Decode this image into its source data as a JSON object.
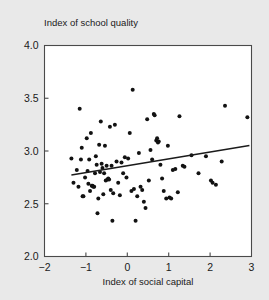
{
  "chart_data": {
    "type": "scatter",
    "title": "",
    "xlabel": "Index of social capital",
    "ylabel": "Index of school quality",
    "ylabel_position": "above-plot-left",
    "xlim": [
      -2,
      3
    ],
    "ylim": [
      2.0,
      4.0
    ],
    "xticks": [
      -2,
      -1,
      0,
      1,
      2,
      3
    ],
    "xticklabels": [
      "-2",
      "-1",
      "0",
      "1",
      "2",
      "3"
    ],
    "yticks": [
      2.0,
      2.5,
      3.0,
      3.5,
      4.0
    ],
    "yticklabels": [
      "2.0",
      "2.5",
      "3.0",
      "3.5",
      "4.0"
    ],
    "grid": false,
    "legend": false,
    "marker": "filled-circle",
    "marker_color": "#121212",
    "marker_size": 3.6,
    "plot_background": "#ffffff",
    "figure_background": "#e9e9e9",
    "frame_color": "#4a4a4a",
    "n_points": 95,
    "series": [
      {
        "name": "counties",
        "points": [
          [
            -1.35,
            2.93
          ],
          [
            -1.3,
            2.7
          ],
          [
            -1.22,
            2.82
          ],
          [
            -1.18,
            2.66
          ],
          [
            -1.15,
            3.4
          ],
          [
            -1.12,
            2.92
          ],
          [
            -1.1,
            3.03
          ],
          [
            -1.08,
            2.57
          ],
          [
            -1.06,
            2.57
          ],
          [
            -1.02,
            2.75
          ],
          [
            -0.98,
            3.12
          ],
          [
            -0.96,
            2.81
          ],
          [
            -0.94,
            2.69
          ],
          [
            -0.92,
            2.92
          ],
          [
            -0.9,
            2.62
          ],
          [
            -0.88,
            3.17
          ],
          [
            -0.86,
            2.67
          ],
          [
            -0.84,
            2.67
          ],
          [
            -0.82,
            2.66
          ],
          [
            -0.8,
            2.66
          ],
          [
            -0.78,
            2.79
          ],
          [
            -0.76,
            2.95
          ],
          [
            -0.74,
            2.87
          ],
          [
            -0.72,
            2.41
          ],
          [
            -0.7,
            2.55
          ],
          [
            -0.68,
            3.06
          ],
          [
            -0.66,
            2.8
          ],
          [
            -0.64,
            3.28
          ],
          [
            -0.62,
            2.88
          ],
          [
            -0.6,
            2.84
          ],
          [
            -0.58,
            2.59
          ],
          [
            -0.56,
            2.79
          ],
          [
            -0.54,
            3.05
          ],
          [
            -0.52,
            2.72
          ],
          [
            -0.5,
            2.86
          ],
          [
            -0.48,
            2.73
          ],
          [
            -0.46,
            2.74
          ],
          [
            -0.44,
            2.73
          ],
          [
            -0.42,
            3.23
          ],
          [
            -0.4,
            2.63
          ],
          [
            -0.38,
            2.86
          ],
          [
            -0.36,
            2.34
          ],
          [
            -0.34,
            2.6
          ],
          [
            -0.3,
            3.25
          ],
          [
            -0.26,
            2.9
          ],
          [
            -0.22,
            2.7
          ],
          [
            -0.18,
            2.58
          ],
          [
            -0.14,
            2.89
          ],
          [
            -0.1,
            2.79
          ],
          [
            -0.06,
            2.94
          ],
          [
            -0.02,
            2.75
          ],
          [
            0.02,
            2.93
          ],
          [
            0.06,
            3.17
          ],
          [
            0.1,
            2.62
          ],
          [
            0.13,
            3.58
          ],
          [
            0.16,
            2.64
          ],
          [
            0.2,
            2.34
          ],
          [
            0.24,
            2.57
          ],
          [
            0.28,
            2.98
          ],
          [
            0.32,
            2.66
          ],
          [
            0.36,
            2.63
          ],
          [
            0.4,
            2.52
          ],
          [
            0.44,
            2.46
          ],
          [
            0.48,
            3.3
          ],
          [
            0.52,
            2.72
          ],
          [
            0.56,
            3.01
          ],
          [
            0.6,
            2.92
          ],
          [
            0.64,
            3.35
          ],
          [
            0.66,
            3.34
          ],
          [
            0.7,
            3.1
          ],
          [
            0.72,
            3.12
          ],
          [
            0.74,
            3.08
          ],
          [
            0.76,
            3.09
          ],
          [
            0.8,
            2.87
          ],
          [
            0.84,
            2.74
          ],
          [
            0.88,
            2.62
          ],
          [
            0.94,
            2.55
          ],
          [
            0.98,
            3.05
          ],
          [
            1.02,
            2.56
          ],
          [
            1.06,
            2.55
          ],
          [
            1.1,
            2.82
          ],
          [
            1.16,
            2.83
          ],
          [
            1.22,
            2.61
          ],
          [
            1.26,
            3.33
          ],
          [
            1.34,
            2.86
          ],
          [
            1.38,
            2.85
          ],
          [
            1.55,
            2.96
          ],
          [
            1.72,
            2.79
          ],
          [
            1.9,
            2.95
          ],
          [
            2.02,
            2.72
          ],
          [
            2.06,
            2.7
          ],
          [
            2.14,
            2.68
          ],
          [
            2.28,
            2.9
          ],
          [
            2.36,
            3.43
          ],
          [
            2.9,
            3.32
          ]
        ]
      }
    ],
    "fit_line": {
      "type": "linear-regression",
      "x_start": -1.35,
      "y_start": 2.772,
      "x_end": 2.95,
      "y_end": 3.052
    }
  }
}
